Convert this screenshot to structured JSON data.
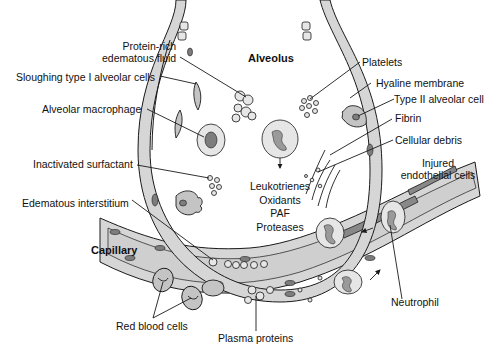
{
  "diagram": {
    "title_labels": {
      "alveolus": "Alveolus",
      "capillary": "Capillary"
    },
    "labels": {
      "protein_rich_fluid_line1": "Protein-rich",
      "protein_rich_fluid_line2": "edematous fluid",
      "sloughing_type1": "Sloughing type I alveolar cells",
      "alveolar_macrophage": "Alveolar macrophage",
      "inactivated_surfactant": "Inactivated surfactant",
      "edematous_interstitium": "Edematous interstitium",
      "platelets": "Platelets",
      "hyaline_membrane": "Hyaline membrane",
      "type2_alveolar_cell": "Type II alveolar cell",
      "fibrin": "Fibrin",
      "cellular_debris": "Cellular debris",
      "injured_endothelial_line1": "Injured",
      "injured_endothelial_line2": "endothelial cells",
      "neutrophil": "Neutrophil",
      "red_blood_cells": "Red blood cells",
      "plasma_proteins": "Plasma proteins"
    },
    "mediators": [
      "Leukotrienes",
      "Oxidants",
      "PAF",
      "Proteases"
    ],
    "colors": {
      "outline": "#1a1a1a",
      "wall_fill": "#d4d4d4",
      "cell_fill": "#bdbdbd",
      "nucleus": "#7a7a7a",
      "injured": "#8a8a8a",
      "background": "#ffffff"
    }
  }
}
